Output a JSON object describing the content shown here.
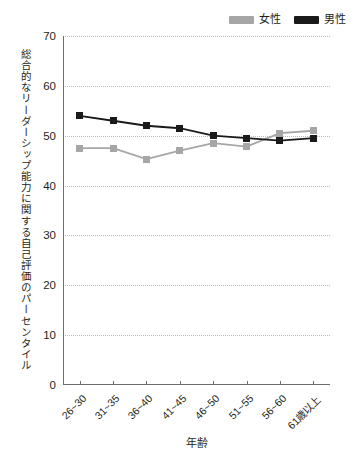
{
  "legend": {
    "position": "top-right",
    "entries": [
      {
        "label": "女性",
        "color": "#a6a6a6",
        "swatch_name": "legend-swatch-female"
      },
      {
        "label": "男性",
        "color": "#1a1a1a",
        "swatch_name": "legend-swatch-male"
      }
    ]
  },
  "axes": {
    "ylabel": "総合的なリーダーシップ能力に関する自己評価のパーセンタイル",
    "xlabel": "年齢",
    "yticks": [
      "0",
      "10",
      "20",
      "30",
      "40",
      "50",
      "60",
      "70"
    ],
    "ymin": 0,
    "ymax": 70,
    "ystep": 10
  },
  "chart_data": {
    "type": "line",
    "title": "",
    "subtitle": "",
    "xlabel": "年齢",
    "ylabel": "総合的なリーダーシップ能力に関する自己評価のパーセンタイル",
    "categories": [
      "26~30",
      "31~35",
      "36~40",
      "41~45",
      "46~50",
      "51~55",
      "56~60",
      "61歳以上"
    ],
    "series": [
      {
        "name": "女性",
        "color": "#a6a6a6",
        "values": [
          47.5,
          47.5,
          45.3,
          47.0,
          48.5,
          47.8,
          50.5,
          51.0
        ]
      },
      {
        "name": "男性",
        "color": "#1a1a1a",
        "values": [
          54.0,
          53.0,
          52.0,
          51.5,
          50.0,
          49.5,
          49.0,
          49.5
        ]
      }
    ],
    "ylim": [
      0,
      70
    ],
    "yticks": [
      0,
      10,
      20,
      30,
      40,
      50,
      60,
      70
    ],
    "grid": true,
    "grid_style": "dotted-horizontal",
    "legend": true,
    "legend_position": "top-right",
    "marker": "square"
  }
}
